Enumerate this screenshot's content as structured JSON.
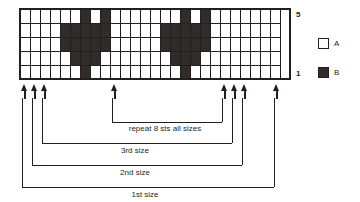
{
  "chart_data": {
    "type": "heatmap",
    "xlabel": "",
    "ylabel": "",
    "rows": 5,
    "columns": 26,
    "row_labels": [
      "1",
      "2",
      "3",
      "4",
      "5"
    ],
    "visible_row_labels": {
      "top": "5",
      "bottom": "1"
    },
    "symbols": {
      "A": "white",
      "B": "dark"
    },
    "legend_position": "right",
    "grid": [
      [
        "A",
        "A",
        "A",
        "A",
        "A",
        "A",
        "B",
        "A",
        "B",
        "A",
        "A",
        "A",
        "A",
        "A",
        "A",
        "A",
        "B",
        "A",
        "B",
        "A",
        "A",
        "A",
        "A",
        "A",
        "A",
        "A"
      ],
      [
        "A",
        "A",
        "A",
        "A",
        "B",
        "B",
        "B",
        "B",
        "B",
        "A",
        "A",
        "A",
        "A",
        "A",
        "B",
        "B",
        "B",
        "B",
        "B",
        "A",
        "A",
        "A",
        "A",
        "A",
        "A",
        "A"
      ],
      [
        "A",
        "A",
        "A",
        "A",
        "B",
        "B",
        "B",
        "B",
        "B",
        "A",
        "A",
        "A",
        "A",
        "A",
        "B",
        "B",
        "B",
        "B",
        "B",
        "A",
        "A",
        "A",
        "A",
        "A",
        "A",
        "A"
      ],
      [
        "A",
        "A",
        "A",
        "A",
        "A",
        "B",
        "B",
        "B",
        "A",
        "A",
        "A",
        "A",
        "A",
        "A",
        "A",
        "B",
        "B",
        "B",
        "A",
        "A",
        "A",
        "A",
        "A",
        "A",
        "A",
        "A"
      ],
      [
        "A",
        "A",
        "A",
        "A",
        "A",
        "A",
        "B",
        "A",
        "A",
        "A",
        "A",
        "A",
        "A",
        "A",
        "A",
        "A",
        "B",
        "A",
        "A",
        "A",
        "A",
        "A",
        "A",
        "A",
        "A",
        "A"
      ]
    ],
    "grid_note": "grid[0] is chart row 5 (top); grid[4] is chart row 1 (bottom)",
    "size_markers": {
      "arrow_columns": [
        0,
        1,
        2,
        9,
        20,
        21,
        22
      ],
      "repeat_span_columns": [
        9,
        20
      ],
      "third_size_span_columns": [
        2,
        21
      ],
      "second_size_span_columns": [
        1,
        22
      ],
      "first_size_span_columns": [
        0,
        23
      ]
    }
  },
  "legend": {
    "items": [
      {
        "symbol": "A",
        "label": "A",
        "color": "#ffffff"
      },
      {
        "symbol": "B",
        "label": "B",
        "color": "#2f2c2b"
      }
    ]
  },
  "row_numbers": {
    "top": "5",
    "bottom": "1"
  },
  "captions": {
    "repeat": "repeat 8 sts all sizes",
    "third_size": "3rd size",
    "second_size": "2nd size",
    "first_size": "1st size"
  },
  "colors": {
    "ink": "#231f20",
    "colorA": "#ffffff",
    "colorB": "#2f2c2b",
    "background": "#ffffff"
  }
}
